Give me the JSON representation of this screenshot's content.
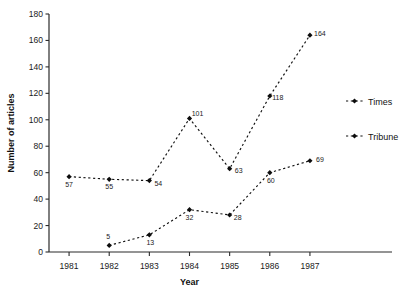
{
  "chart_data": {
    "type": "line",
    "title": "",
    "xlabel": "Year",
    "ylabel": "Number of articles",
    "x": [
      1981,
      1982,
      1983,
      1984,
      1985,
      1986,
      1987
    ],
    "xticklabels": [
      "1981",
      "1982",
      "1983",
      "1984",
      "1985",
      "1986",
      "1987"
    ],
    "yticklabels": [
      "0",
      "20",
      "40",
      "60",
      "80",
      "100",
      "120",
      "140",
      "160",
      "180"
    ],
    "yticks": [
      0,
      20,
      40,
      60,
      80,
      100,
      120,
      140,
      160,
      180
    ],
    "ylim": [
      0,
      180
    ],
    "xlim": [
      1980.5,
      1987.5
    ],
    "grid": false,
    "legend_position": "right-middle",
    "line_style": "dashed",
    "marker_style": "filled-diamond",
    "series": [
      {
        "name": "Times",
        "color": "#111111",
        "x": [
          1981,
          1982,
          1983,
          1984,
          1985,
          1986,
          1987
        ],
        "values": [
          57,
          55,
          54,
          101,
          63,
          118,
          164
        ],
        "point_labels": [
          "57",
          "55",
          "54",
          "101",
          "63",
          "118",
          "164"
        ]
      },
      {
        "name": "Tribune",
        "color": "#111111",
        "x": [
          1982,
          1983,
          1984,
          1985,
          1986,
          1987
        ],
        "values": [
          5,
          13,
          32,
          28,
          60,
          69
        ],
        "point_labels": [
          "5",
          "13",
          "32",
          "28",
          "60",
          "69"
        ]
      }
    ],
    "legend": [
      {
        "label": "Times"
      },
      {
        "label": "Tribune"
      }
    ]
  }
}
